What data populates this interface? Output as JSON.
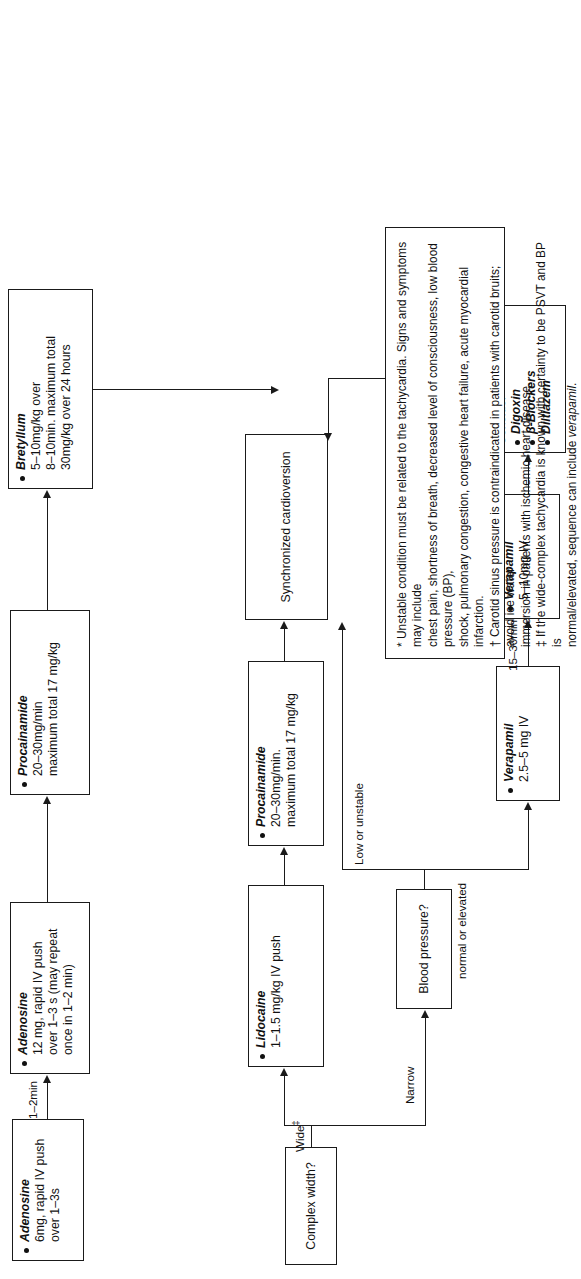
{
  "diagram": {
    "nodes": {
      "complex_width": {
        "label": "Complex width?"
      },
      "blood_pressure": {
        "label": "Blood pressure?"
      },
      "adenosine6": {
        "drug": "Adenosine",
        "dose": "6mg, rapid IV push\nover 1–3s"
      },
      "adenosine12": {
        "drug": "Adenosine",
        "dose": "12 mg, rapid IV push\nover 1–3 s (may repeat\nonce in 1–2 min)"
      },
      "procainamide_top": {
        "drug": "Procainamide",
        "dose": "20–30mg/min\nmaximum total 17 mg/kg"
      },
      "bretylium": {
        "drug": "Bretyllum",
        "dose": "5–10mg/kg over\n8–10min. maximum total\n30mg/kg over 24 hours"
      },
      "lidocaine": {
        "drug": "Lidocaine",
        "dose": "1–1.5 mg/kg IV push"
      },
      "procainamide_mid": {
        "drug": "Procainamide",
        "dose": "20–30mg/min.\nmaximum total 17 mg/kg"
      },
      "cardioversion": {
        "label": "Synchronized cardioversion"
      },
      "verapamil1": {
        "drug": "Verapamil",
        "dose": "2.5–5 mg IV"
      },
      "verapamil2": {
        "drug": "Verapamil",
        "dose": "5–10mg IV"
      },
      "consider": {
        "label": "Consider",
        "items": [
          "Digoxin",
          "β-Blockers",
          "Diltiazem"
        ]
      }
    },
    "edge_labels": {
      "wide": "Wide",
      "wide_marker": "‡",
      "narrow": "Narrow",
      "one_to_two_min": "1–2min",
      "fifteen_to_thirty_min": "15–30min",
      "low_or_unstable": "Low or unstable",
      "normal_or_elevated": "normal or elevated"
    },
    "footnotes": {
      "line1": "* Unstable condition must be related to the tachycardia. Signs and symptoms may include",
      "line2": "chest pain, shortness of breath, decreased level of consciousness, low blood pressure (BP),",
      "line3": "shock, pulmonary congestion, congestive heart failure, acute myocardial infarction.",
      "line4": "† Carotid sinus pressure is contraindicated in patients with carotid bruits; avoid ice water",
      "line5": "immersion in patients with ischemic heart disease.",
      "line6": "‡ If the wide-complex tachycardia is known with certainty to be PSVT and BP is",
      "line7_pre": "normal/elevated, sequence can include ",
      "line7_em": "verapamil",
      "line7_post": "."
    }
  }
}
